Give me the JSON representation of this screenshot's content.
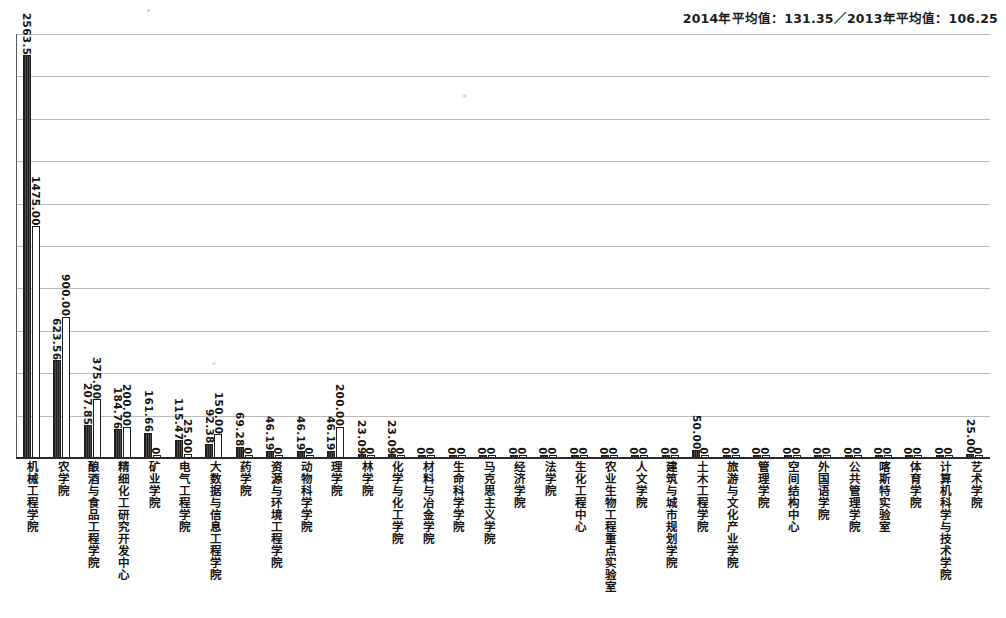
{
  "header": {
    "note": "2014年平均值：131.35／2013年平均值：106.25"
  },
  "chart_data": {
    "type": "bar",
    "title": "",
    "subtitle": "2014年平均值：131.35／2013年平均值：106.25",
    "xlabel": "",
    "ylabel": "",
    "ylim": [
      0,
      2700
    ],
    "grid": true,
    "gridlines": 10,
    "legend_position": "none",
    "annotations": [
      "2014年平均值：131.35",
      "2013年平均值：106.25"
    ],
    "averages": {
      "2014": 131.35,
      "2013": 106.25
    },
    "categories": [
      "机械工程学院",
      "农学院",
      "酿酒与食品工程学院",
      "精细化工研究开发中心",
      "矿业学院",
      "电气工程学院",
      "大数据与信息工程学院",
      "药学院",
      "资源与环境工程学院",
      "动物科学学院",
      "理学院",
      "林学院",
      "化学与化工学院",
      "材料与冶金学院",
      "生命科学学院",
      "马克思主义学院",
      "经济学院",
      "法学院",
      "生化工程中心",
      "农业生物工程重点实验室",
      "人文学院",
      "建筑与城市规划学院",
      "土木工程学院",
      "旅游与文化产业学院",
      "管理学院",
      "空间结构中心",
      "外国语学院",
      "公共管理学院",
      "喀斯特实验室",
      "体育学院",
      "计算机科学与技术学院",
      "艺术学院"
    ],
    "series": [
      {
        "name": "2014年",
        "values": [
          2563.5,
          623.56,
          207.85,
          184.76,
          161.66,
          115.47,
          92.38,
          69.28,
          46.19,
          46.19,
          46.19,
          23.09,
          23.09,
          0,
          0,
          0,
          0,
          0,
          0,
          0,
          0,
          0,
          50.0,
          0,
          0,
          0,
          0,
          0,
          0,
          0,
          0,
          25.0
        ],
        "labels": [
          "2563.5",
          "623.56",
          "207.85",
          "184.76",
          "161.66",
          "115.47",
          "92.38",
          "69.28",
          "46.19",
          "46.19",
          "46.19",
          "23.09",
          "23.09",
          "0",
          "0",
          "0",
          "0",
          "0",
          "0",
          "0",
          "0",
          "0",
          "50.00",
          "0",
          "0",
          "0",
          "0",
          "0",
          "0",
          "0",
          "0",
          "25.00"
        ]
      },
      {
        "name": "2013年",
        "values": [
          1475.0,
          900.0,
          375.0,
          200.0,
          0,
          25.0,
          150.0,
          0,
          0,
          0,
          200.0,
          0,
          0,
          0,
          0,
          0,
          0,
          0,
          0,
          0,
          0,
          0,
          0,
          0,
          0,
          0,
          0,
          0,
          0,
          0,
          0,
          0
        ],
        "labels": [
          "1475.00",
          "900.00",
          "375.00",
          "200.00",
          "0",
          "25.00",
          "150.00",
          "0",
          "0",
          "0",
          "200.00",
          "0",
          "0",
          "0",
          "0",
          "0",
          "0",
          "0",
          "0",
          "0",
          "0",
          "0",
          "0",
          "0",
          "0",
          "0",
          "0",
          "0",
          "0",
          "0",
          "0",
          "0"
        ]
      }
    ]
  }
}
